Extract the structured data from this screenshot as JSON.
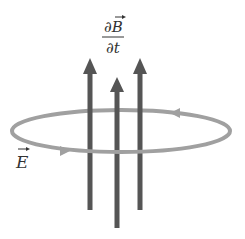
{
  "diagram": {
    "labels": {
      "dB_numerator": "∂B",
      "dt_denominator": "∂t",
      "E_label": "E"
    },
    "colors": {
      "arrow": "#555555",
      "loop": "#a0a0a0",
      "text": "#333333",
      "background": "#ffffff"
    },
    "arrows": [
      {
        "name": "left",
        "x": 90,
        "tip_y": 58,
        "end_y": 210
      },
      {
        "name": "middle",
        "x": 117,
        "tip_y": 77,
        "end_y": 228
      },
      {
        "name": "right",
        "x": 140,
        "tip_y": 58,
        "end_y": 210
      }
    ],
    "loop": {
      "cx": 121,
      "cy": 131,
      "rx": 109,
      "ry": 21
    }
  }
}
